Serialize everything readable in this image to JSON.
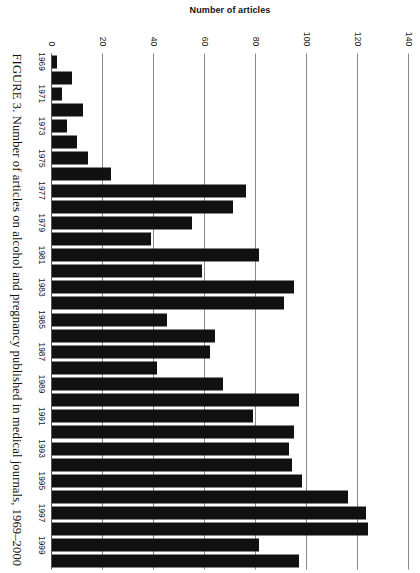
{
  "figure": {
    "label": "FIGURE 3.",
    "caption_text": "Number of articles on alcohol and pregnancy published in medical journals,",
    "caption_years": "1969–2000",
    "orientation": "rotated-90-clockwise"
  },
  "chart_data": {
    "type": "bar",
    "title": "Number of articles on alcohol and pregnancy published in medical journals, 1969–2000",
    "xlabel": "",
    "ylabel": "Number of articles",
    "ylim": [
      0,
      140
    ],
    "yticks": [
      0,
      20,
      40,
      60,
      80,
      100,
      120,
      140
    ],
    "grid": true,
    "legend": "none",
    "orientation": "horizontal-bars-printed-sideways",
    "bar_color": "#111111",
    "categories": [
      "1969",
      "1970",
      "1971",
      "1972",
      "1973",
      "1974",
      "1975",
      "1976",
      "1977",
      "1978",
      "1979",
      "1980",
      "1981",
      "1982",
      "1983",
      "1984",
      "1985",
      "1986",
      "1987",
      "1988",
      "1989",
      "1990",
      "1991",
      "1992",
      "1993",
      "1994",
      "1995",
      "1996",
      "1997",
      "1998",
      "1999",
      "2000"
    ],
    "values": [
      2,
      8,
      4,
      12,
      6,
      10,
      14,
      23,
      76,
      71,
      55,
      39,
      81,
      59,
      95,
      91,
      45,
      64,
      62,
      41,
      67,
      97,
      79,
      95,
      93,
      94,
      98,
      116,
      123,
      124,
      81,
      97
    ],
    "tick_labels_shown": [
      "1969",
      "1971",
      "1973",
      "1975",
      "1977",
      "1979",
      "1981",
      "1983",
      "1985",
      "1987",
      "1989",
      "1991",
      "1993",
      "1995",
      "1997",
      "1999"
    ]
  },
  "axis": {
    "value_ticks": [
      "0",
      "20",
      "40",
      "60",
      "80",
      "100",
      "120",
      "140"
    ],
    "value_title": "Number of articles"
  }
}
